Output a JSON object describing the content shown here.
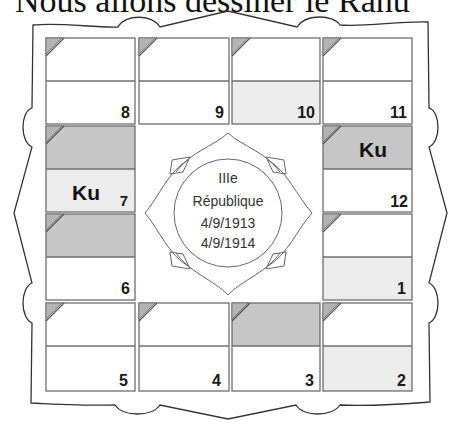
{
  "header": {
    "title": "Nous allons dessiner le Rahu"
  },
  "chart": {
    "type": "north-indian-style square horoscope (Kundali)",
    "center": {
      "lines": [
        "IIIe",
        "République",
        "4/9/1913",
        "4/9/1914"
      ]
    },
    "colors": {
      "dark": "#c6c6c6",
      "light": "#ececec",
      "white": "#ffffff",
      "border": "#6e6e6e"
    },
    "houses": {
      "h8": {
        "number": "8",
        "top_fill": "#ffffff",
        "bottom_fill": "#ffffff"
      },
      "h9": {
        "number": "9",
        "top_fill": "#ffffff",
        "bottom_fill": "#ffffff"
      },
      "h10": {
        "number": "10",
        "top_fill": "#ffffff",
        "bottom_fill": "#ececec"
      },
      "h11": {
        "number": "11",
        "top_fill": "#ffffff",
        "bottom_fill": "#ffffff"
      },
      "h7": {
        "number": "7",
        "top_fill": "#c6c6c6",
        "bottom_fill": "#ececec",
        "planet": "Ku"
      },
      "h12": {
        "number": "12",
        "top_fill": "#c6c6c6",
        "bottom_fill": "#ffffff",
        "planet": "Ku"
      },
      "h6": {
        "number": "6",
        "top_fill": "#c6c6c6",
        "bottom_fill": "#ffffff"
      },
      "h1": {
        "number": "1",
        "top_fill": "#ffffff",
        "bottom_fill": "#ececec"
      },
      "h5": {
        "number": "5",
        "top_fill": "#ffffff",
        "bottom_fill": "#ffffff"
      },
      "h4": {
        "number": "4",
        "top_fill": "#ffffff",
        "bottom_fill": "#ffffff"
      },
      "h3": {
        "number": "3",
        "top_fill": "#c6c6c6",
        "bottom_fill": "#ffffff"
      },
      "h2": {
        "number": "2",
        "top_fill": "#ffffff",
        "bottom_fill": "#ececec"
      }
    }
  }
}
